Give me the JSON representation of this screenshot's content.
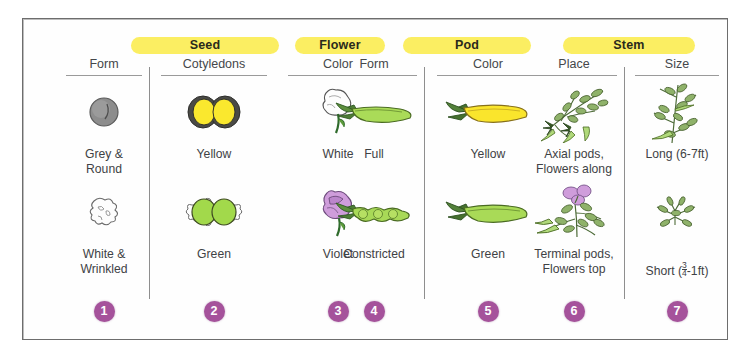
{
  "figure": {
    "accent_yellow": "#fbee62",
    "accent_purple": "#a5529b",
    "text_color": "#3f4245"
  },
  "groups": [
    {
      "label": "Seed",
      "left": 108,
      "width": 148
    },
    {
      "label": "Flower",
      "left": 272,
      "width": 90
    },
    {
      "label": "Pod",
      "left": 380,
      "width": 128
    },
    {
      "label": "Stem",
      "left": 540,
      "width": 132
    }
  ],
  "columns": [
    {
      "group": "Seed",
      "header": "Form",
      "number": "1",
      "dominant": {
        "label": "Grey &\nRound",
        "art": "seed-grey-round-icon"
      },
      "recessive": {
        "label": "White &\nWrinkled",
        "art": "seed-white-wrinkled-icon"
      }
    },
    {
      "group": "Seed",
      "header": "Cotyledons",
      "number": "2",
      "dominant": {
        "label": "Yellow",
        "art": "cotyledon-yellow-icon"
      },
      "recessive": {
        "label": "Green",
        "art": "cotyledon-green-icon"
      }
    },
    {
      "group": "Flower",
      "header": "Color",
      "number": "3",
      "dominant": {
        "label": "White",
        "art": "flower-white-icon"
      },
      "recessive": {
        "label": "Violet",
        "art": "flower-violet-icon"
      }
    },
    {
      "group": "Pod",
      "header": "Form",
      "number": "4",
      "dominant": {
        "label": "Full",
        "art": "pod-full-icon"
      },
      "recessive": {
        "label": "Constricted",
        "art": "pod-constricted-icon"
      }
    },
    {
      "group": "Pod",
      "header": "Color",
      "number": "5",
      "dominant": {
        "label": "Yellow",
        "art": "pod-yellow-icon"
      },
      "recessive": {
        "label": "Green",
        "art": "pod-green-icon"
      }
    },
    {
      "group": "Stem",
      "header": "Place",
      "number": "6",
      "dominant": {
        "label": "Axial pods,\nFlowers along",
        "art": "stem-axial-icon"
      },
      "recessive": {
        "label": "Terminal pods,\nFlowers top",
        "art": "stem-terminal-icon"
      }
    },
    {
      "group": "Stem",
      "header": "Size",
      "number": "7",
      "dominant": {
        "label": "Long (6-7ft)",
        "art": "stem-long-icon"
      },
      "recessive": {
        "label_prefix": "Short (",
        "fraction_num": "3",
        "fraction_den": "4",
        "label_suffix": "-1ft)",
        "art": "stem-short-icon"
      }
    }
  ]
}
